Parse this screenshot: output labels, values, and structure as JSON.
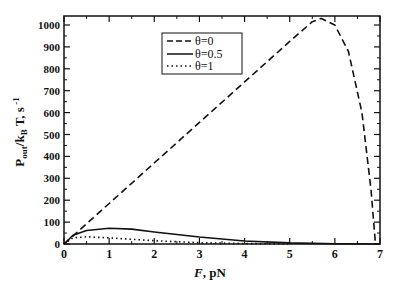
{
  "chart_data": {
    "type": "line",
    "title": "",
    "xlabel": "F, pN",
    "ylabel": "P_out/k_B T, s^-1",
    "xlim": [
      0,
      7
    ],
    "ylim": [
      0,
      1050
    ],
    "xticks": [
      "0",
      "1",
      "2",
      "3",
      "4",
      "5",
      "6",
      "7"
    ],
    "yticks": [
      "0",
      "100",
      "200",
      "300",
      "400",
      "500",
      "600",
      "700",
      "800",
      "900",
      "1000"
    ],
    "grid": false,
    "legend_position": "upper-center",
    "series": [
      {
        "name": "θ=0",
        "style": "dashed",
        "x": [
          0,
          1,
          2,
          3,
          4,
          5,
          5.5,
          5.7,
          6.0,
          6.3,
          6.6,
          6.8,
          6.9
        ],
        "y": [
          0,
          185,
          370,
          555,
          740,
          925,
          1015,
          1030,
          1000,
          880,
          600,
          250,
          0
        ]
      },
      {
        "name": "θ=0.5",
        "style": "solid",
        "x": [
          0,
          0.2,
          0.5,
          1.0,
          1.5,
          2,
          3,
          4,
          5,
          6,
          7
        ],
        "y": [
          0,
          40,
          62,
          72,
          68,
          55,
          32,
          14,
          5,
          1,
          0
        ]
      },
      {
        "name": "θ=1",
        "style": "dotted",
        "x": [
          0,
          0.2,
          0.5,
          1,
          2,
          3,
          4,
          5
        ],
        "y": [
          0,
          28,
          33,
          28,
          15,
          6,
          2,
          0
        ]
      }
    ]
  },
  "axes": {
    "xlabel_italic": "F",
    "xlabel_rest": ", pN"
  },
  "legend": {
    "items": [
      "θ=0",
      "θ=0.5",
      "θ=1"
    ]
  }
}
